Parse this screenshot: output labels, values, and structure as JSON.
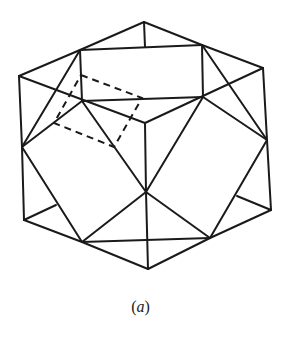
{
  "figure": {
    "type": "polyhedron-line-drawing",
    "stroke_color": "#1a1a1a",
    "background": "#ffffff",
    "vertices": {
      "top": [
        144,
        22
      ],
      "rect_tl": [
        80,
        50
      ],
      "rect_tr": [
        202,
        45
      ],
      "rect_bl": [
        82,
        101
      ],
      "rect_br": [
        203,
        97
      ],
      "top_mid": [
        145,
        47
      ],
      "far_left_upper": [
        19,
        76
      ],
      "far_right_upper": [
        263,
        68
      ],
      "center": [
        145,
        123
      ],
      "left_mid": [
        22,
        147
      ],
      "right_mid": [
        267,
        140
      ],
      "lower_center": [
        146,
        192
      ],
      "bottom_left": [
        24,
        220
      ],
      "bottom_right": [
        271,
        210
      ],
      "left_inner": [
        56,
        205
      ],
      "right_inner": [
        237,
        196
      ],
      "bottom_lc": [
        82,
        242
      ],
      "bottom_rc": [
        210,
        238
      ],
      "bottom": [
        148,
        269
      ]
    },
    "edges": [
      [
        "top",
        "rect_tl"
      ],
      [
        "top",
        "rect_tr"
      ],
      [
        "top",
        "top_mid"
      ],
      [
        "rect_tl",
        "rect_tr"
      ],
      [
        "rect_tl",
        "rect_bl"
      ],
      [
        "rect_tr",
        "rect_br"
      ],
      [
        "rect_bl",
        "rect_br"
      ],
      [
        "rect_tl",
        "far_left_upper"
      ],
      [
        "rect_tr",
        "far_right_upper"
      ],
      [
        "far_left_upper",
        "center"
      ],
      [
        "far_right_upper",
        "center"
      ],
      [
        "rect_tl",
        "left_mid"
      ],
      [
        "rect_tr",
        "right_mid"
      ],
      [
        "rect_bl",
        "left_mid"
      ],
      [
        "rect_br",
        "right_mid"
      ],
      [
        "far_left_upper",
        "left_mid"
      ],
      [
        "far_right_upper",
        "right_mid"
      ],
      [
        "center",
        "lower_center"
      ],
      [
        "rect_bl",
        "lower_center"
      ],
      [
        "rect_br",
        "lower_center"
      ],
      [
        "left_mid",
        "bottom_left"
      ],
      [
        "right_mid",
        "bottom_right"
      ],
      [
        "left_mid",
        "bottom_lc"
      ],
      [
        "right_mid",
        "bottom_rc"
      ],
      [
        "bottom_left",
        "left_inner"
      ],
      [
        "bottom_right",
        "right_inner"
      ],
      [
        "bottom_left",
        "bottom_lc"
      ],
      [
        "bottom_right",
        "bottom_rc"
      ],
      [
        "lower_center",
        "bottom_lc"
      ],
      [
        "lower_center",
        "bottom_rc"
      ],
      [
        "lower_center",
        "bottom"
      ],
      [
        "bottom_lc",
        "bottom_rc"
      ],
      [
        "bottom_lc",
        "bottom"
      ],
      [
        "bottom_rc",
        "bottom"
      ]
    ],
    "hidden_square": [
      [
        81,
        75
      ],
      [
        142,
        98
      ],
      [
        114,
        147
      ],
      [
        54,
        123
      ]
    ]
  },
  "caption": {
    "open": "(",
    "letter": "a",
    "close": ")"
  }
}
